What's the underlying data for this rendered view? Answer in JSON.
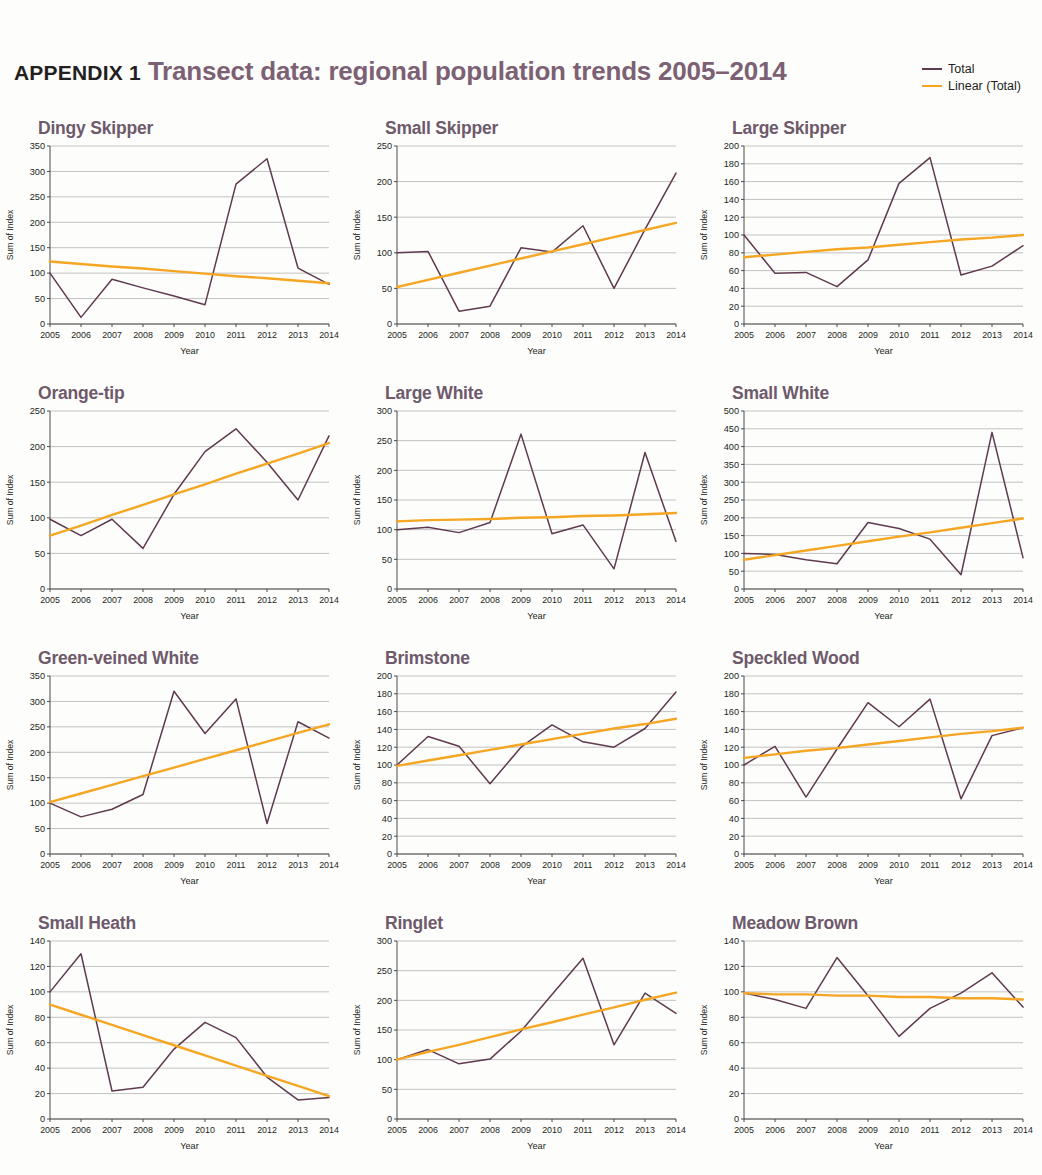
{
  "header": {
    "appendix_label": "APPENDIX 1",
    "title": "Transect data: regional population trends 2005–2014"
  },
  "legend": {
    "items": [
      {
        "label": "Total",
        "color": "#5f3a4f"
      },
      {
        "label": "Linear (Total)",
        "color": "#f5a623"
      }
    ]
  },
  "colors": {
    "total": "#5f3a4f",
    "trend": "#f5a623",
    "title_purple": "#7c6073",
    "chart_title": "#6e5a6b",
    "gridline": "#a9a9a9",
    "axis": "#4a4a4a",
    "text": "#231f20"
  },
  "axes": {
    "xlabel": "Year",
    "ylabel": "Sum of Index",
    "categories": [
      "2005",
      "2006",
      "2007",
      "2008",
      "2009",
      "2010",
      "2011",
      "2012",
      "2013",
      "2014"
    ]
  },
  "chart_data": [
    {
      "type": "line",
      "title": "Dingy Skipper",
      "xlabel": "Year",
      "ylabel": "Sum of Index",
      "categories": [
        "2005",
        "2006",
        "2007",
        "2008",
        "2009",
        "2010",
        "2011",
        "2012",
        "2013",
        "2014"
      ],
      "ylim": [
        0,
        350
      ],
      "ystep": 50,
      "yticks": [
        0,
        50,
        100,
        150,
        200,
        250,
        300,
        350
      ],
      "grid": true,
      "legend_position": "figure-top-right",
      "series": [
        {
          "name": "Total",
          "values": [
            100,
            13,
            88,
            71,
            55,
            38,
            275,
            325,
            110,
            78
          ]
        },
        {
          "name": "Linear (Total)",
          "values": [
            123,
            118,
            113,
            109,
            104,
            99,
            94,
            90,
            85,
            80
          ]
        }
      ]
    },
    {
      "type": "line",
      "title": "Small Skipper",
      "xlabel": "Year",
      "ylabel": "Sum of Index",
      "categories": [
        "2005",
        "2006",
        "2007",
        "2008",
        "2009",
        "2010",
        "2011",
        "2012",
        "2013",
        "2014"
      ],
      "ylim": [
        0,
        250
      ],
      "ystep": 50,
      "yticks": [
        0,
        50,
        100,
        150,
        200,
        250
      ],
      "grid": true,
      "legend_position": "figure-top-right",
      "series": [
        {
          "name": "Total",
          "values": [
            100,
            102,
            18,
            25,
            107,
            101,
            138,
            50,
            133,
            212
          ]
        },
        {
          "name": "Linear (Total)",
          "values": [
            52,
            62,
            72,
            82,
            92,
            102,
            112,
            122,
            132,
            142
          ]
        }
      ]
    },
    {
      "type": "line",
      "title": "Large Skipper",
      "xlabel": "Year",
      "ylabel": "Sum of Index",
      "categories": [
        "2005",
        "2006",
        "2007",
        "2008",
        "2009",
        "2010",
        "2011",
        "2012",
        "2013",
        "2014"
      ],
      "ylim": [
        0,
        200
      ],
      "ystep": 20,
      "yticks": [
        0,
        20,
        40,
        60,
        80,
        100,
        120,
        140,
        160,
        180,
        200
      ],
      "grid": true,
      "legend_position": "figure-top-right",
      "series": [
        {
          "name": "Total",
          "values": [
            100,
            57,
            58,
            42,
            72,
            158,
            187,
            55,
            65,
            88
          ]
        },
        {
          "name": "Linear (Total)",
          "values": [
            75,
            78,
            81,
            84,
            86,
            89,
            92,
            95,
            97,
            100
          ]
        }
      ]
    },
    {
      "type": "line",
      "title": "Orange-tip",
      "xlabel": "Year",
      "ylabel": "Sum of Index",
      "categories": [
        "2005",
        "2006",
        "2007",
        "2008",
        "2009",
        "2010",
        "2011",
        "2012",
        "2013",
        "2014"
      ],
      "ylim": [
        0,
        250
      ],
      "ystep": 50,
      "yticks": [
        0,
        50,
        100,
        150,
        200,
        250
      ],
      "grid": true,
      "legend_position": "figure-top-right",
      "series": [
        {
          "name": "Total",
          "values": [
            98,
            75,
            98,
            57,
            133,
            193,
            225,
            178,
            125,
            215
          ]
        },
        {
          "name": "Linear (Total)",
          "values": [
            75,
            89,
            104,
            118,
            133,
            147,
            162,
            176,
            190,
            205
          ]
        }
      ]
    },
    {
      "type": "line",
      "title": "Large White",
      "xlabel": "Year",
      "ylabel": "Sum of Index",
      "categories": [
        "2005",
        "2006",
        "2007",
        "2008",
        "2009",
        "2010",
        "2011",
        "2012",
        "2013",
        "2014"
      ],
      "ylim": [
        0,
        300
      ],
      "ystep": 50,
      "yticks": [
        0,
        50,
        100,
        150,
        200,
        250,
        300
      ],
      "grid": true,
      "legend_position": "figure-top-right",
      "series": [
        {
          "name": "Total",
          "values": [
            100,
            104,
            95,
            112,
            261,
            93,
            108,
            34,
            230,
            80
          ]
        },
        {
          "name": "Linear (Total)",
          "values": [
            114,
            116,
            117,
            118,
            120,
            121,
            123,
            124,
            126,
            128
          ]
        }
      ]
    },
    {
      "type": "line",
      "title": "Small White",
      "xlabel": "Year",
      "ylabel": "Sum of Index",
      "categories": [
        "2005",
        "2006",
        "2007",
        "2008",
        "2009",
        "2010",
        "2011",
        "2012",
        "2013",
        "2014"
      ],
      "ylim": [
        0,
        500
      ],
      "ystep": 50,
      "yticks": [
        0,
        50,
        100,
        150,
        200,
        250,
        300,
        350,
        400,
        450,
        500
      ],
      "grid": true,
      "legend_position": "figure-top-right",
      "series": [
        {
          "name": "Total",
          "values": [
            100,
            97,
            82,
            71,
            187,
            170,
            140,
            40,
            440,
            88
          ]
        },
        {
          "name": "Linear (Total)",
          "values": [
            82,
            95,
            108,
            121,
            134,
            147,
            159,
            172,
            185,
            198
          ]
        }
      ]
    },
    {
      "type": "line",
      "title": "Green-veined White",
      "xlabel": "Year",
      "ylabel": "Sum of Index",
      "categories": [
        "2005",
        "2006",
        "2007",
        "2008",
        "2009",
        "2010",
        "2011",
        "2012",
        "2013",
        "2014"
      ],
      "ylim": [
        0,
        350
      ],
      "ystep": 50,
      "yticks": [
        0,
        50,
        100,
        150,
        200,
        250,
        300,
        350
      ],
      "grid": true,
      "legend_position": "figure-top-right",
      "series": [
        {
          "name": "Total",
          "values": [
            100,
            73,
            88,
            117,
            320,
            237,
            305,
            60,
            260,
            228
          ]
        },
        {
          "name": "Linear (Total)",
          "values": [
            102,
            119,
            136,
            153,
            170,
            187,
            204,
            221,
            238,
            255
          ]
        }
      ]
    },
    {
      "type": "line",
      "title": "Brimstone",
      "xlabel": "Year",
      "ylabel": "Sum of Index",
      "categories": [
        "2005",
        "2006",
        "2007",
        "2008",
        "2009",
        "2010",
        "2011",
        "2012",
        "2013",
        "2014"
      ],
      "ylim": [
        0,
        200
      ],
      "ystep": 20,
      "yticks": [
        0,
        20,
        40,
        60,
        80,
        100,
        120,
        140,
        160,
        180,
        200
      ],
      "grid": true,
      "legend_position": "figure-top-right",
      "series": [
        {
          "name": "Total",
          "values": [
            100,
            132,
            121,
            79,
            120,
            145,
            126,
            120,
            141,
            182
          ]
        },
        {
          "name": "Linear (Total)",
          "values": [
            99,
            105,
            111,
            117,
            123,
            129,
            135,
            141,
            146,
            152
          ]
        }
      ]
    },
    {
      "type": "line",
      "title": "Speckled Wood",
      "xlabel": "Year",
      "ylabel": "Sum of Index",
      "categories": [
        "2005",
        "2006",
        "2007",
        "2008",
        "2009",
        "2010",
        "2011",
        "2012",
        "2013",
        "2014"
      ],
      "ylim": [
        0,
        200
      ],
      "ystep": 20,
      "yticks": [
        0,
        20,
        40,
        60,
        80,
        100,
        120,
        140,
        160,
        180,
        200
      ],
      "grid": true,
      "legend_position": "figure-top-right",
      "series": [
        {
          "name": "Total",
          "values": [
            100,
            121,
            64,
            118,
            170,
            143,
            174,
            62,
            133,
            142
          ]
        },
        {
          "name": "Linear (Total)",
          "values": [
            108,
            112,
            116,
            119,
            123,
            127,
            131,
            135,
            138,
            142
          ]
        }
      ]
    },
    {
      "type": "line",
      "title": "Small Heath",
      "xlabel": "Year",
      "ylabel": "Sum of Index",
      "categories": [
        "2005",
        "2006",
        "2007",
        "2008",
        "2009",
        "2010",
        "2011",
        "2012",
        "2013",
        "2014"
      ],
      "ylim": [
        0,
        140
      ],
      "ystep": 20,
      "yticks": [
        0,
        20,
        40,
        60,
        80,
        100,
        120,
        140
      ],
      "grid": true,
      "legend_position": "figure-top-right",
      "series": [
        {
          "name": "Total",
          "values": [
            100,
            130,
            22,
            25,
            55,
            76,
            64,
            33,
            15,
            17
          ]
        },
        {
          "name": "Linear (Total)",
          "values": [
            90,
            82,
            74,
            66,
            58,
            50,
            42,
            34,
            26,
            18
          ]
        }
      ]
    },
    {
      "type": "line",
      "title": "Ringlet",
      "xlabel": "Year",
      "ylabel": "Sum of Index",
      "categories": [
        "2005",
        "2006",
        "2007",
        "2008",
        "2009",
        "2010",
        "2011",
        "2012",
        "2013",
        "2014"
      ],
      "ylim": [
        0,
        300
      ],
      "ystep": 50,
      "yticks": [
        0,
        50,
        100,
        150,
        200,
        250,
        300
      ],
      "grid": true,
      "legend_position": "figure-top-right",
      "series": [
        {
          "name": "Total",
          "values": [
            100,
            117,
            93,
            101,
            148,
            210,
            271,
            125,
            212,
            178
          ]
        },
        {
          "name": "Linear (Total)",
          "values": [
            100,
            113,
            125,
            138,
            151,
            163,
            176,
            188,
            201,
            213
          ]
        }
      ]
    },
    {
      "type": "line",
      "title": "Meadow Brown",
      "xlabel": "Year",
      "ylabel": "Sum of Index",
      "categories": [
        "2005",
        "2006",
        "2007",
        "2008",
        "2009",
        "2010",
        "2011",
        "2012",
        "2013",
        "2014"
      ],
      "ylim": [
        0,
        140
      ],
      "ystep": 20,
      "yticks": [
        0,
        20,
        40,
        60,
        80,
        100,
        120,
        140
      ],
      "grid": true,
      "legend_position": "figure-top-right",
      "series": [
        {
          "name": "Total",
          "values": [
            99,
            94,
            87,
            127,
            97,
            65,
            87,
            99,
            115,
            88
          ]
        },
        {
          "name": "Linear (Total)",
          "values": [
            99,
            98,
            98,
            97,
            97,
            96,
            96,
            95,
            95,
            94
          ]
        }
      ]
    }
  ]
}
